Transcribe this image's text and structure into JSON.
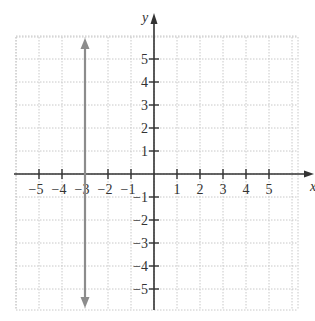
{
  "chart_data": {
    "type": "line",
    "title": "",
    "xlabel": "x",
    "ylabel": "y",
    "xlim": [
      -6,
      6
    ],
    "ylim": [
      -6,
      6
    ],
    "grid": true,
    "x_ticks": [
      -5,
      -4,
      -3,
      -2,
      -1,
      1,
      2,
      3,
      4,
      5
    ],
    "y_ticks": [
      5,
      4,
      3,
      2,
      1,
      -1,
      -2,
      -3,
      -4,
      -5
    ],
    "x_tick_labels": [
      "−5",
      "−4",
      "−3",
      "−2",
      "−1",
      "1",
      "2",
      "3",
      "4",
      "5"
    ],
    "y_tick_labels": [
      "5",
      "4",
      "3",
      "2",
      "1",
      "−1",
      "−2",
      "−3",
      "−4",
      "−5"
    ],
    "series": [
      {
        "name": "x = -3",
        "equation": "x = -3",
        "points": [
          [
            -3,
            6
          ],
          [
            -3,
            -6
          ]
        ],
        "arrows": "both",
        "color": "#8c8c8c"
      }
    ]
  },
  "colors": {
    "axis": "#333333",
    "grid": "#c8c8c8",
    "line": "#8c8c8c"
  }
}
